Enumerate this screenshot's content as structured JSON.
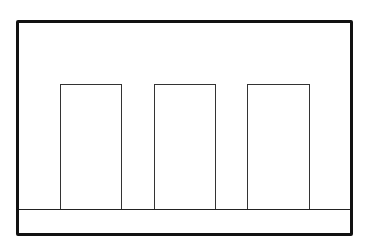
{
  "diagram": {
    "frame": {
      "x": 16,
      "y": 20,
      "width": 337,
      "height": 216,
      "stroke": "#111111"
    },
    "base_strip": {
      "y_top": 209,
      "y_bottom": 233
    },
    "rectangles": [
      {
        "id": "rect-1",
        "x": 60,
        "y": 84,
        "width": 62,
        "height": 125
      },
      {
        "id": "rect-2",
        "x": 154,
        "y": 84,
        "width": 62,
        "height": 125
      },
      {
        "id": "rect-3",
        "x": 247,
        "y": 84,
        "width": 63,
        "height": 125
      }
    ],
    "colors": {
      "stroke": "#222222",
      "background": "#ffffff"
    }
  }
}
